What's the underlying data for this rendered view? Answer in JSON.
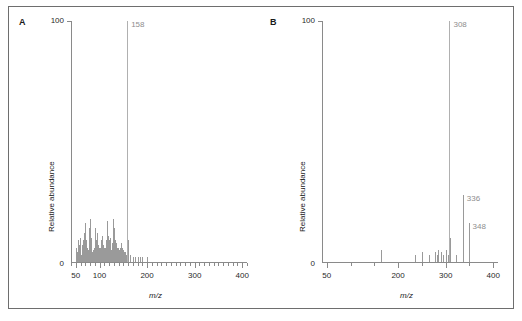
{
  "figure": {
    "width": 522,
    "height": 321,
    "background": "#ffffff",
    "frame_color": "#6e6e6e",
    "axis_color": "#8a8a8a",
    "peak_color": "#9a9a9a",
    "label_color": "#8e8e8e"
  },
  "panels": [
    {
      "letter": "A",
      "y_max_label": "100",
      "y_min_label": "0",
      "y_title": "Relative abundance",
      "x_title": "m/z",
      "annotations": [
        {
          "text": "158",
          "mz": 158
        }
      ]
    },
    {
      "letter": "B",
      "y_max_label": "100",
      "y_min_label": "0",
      "y_title": "Relative abundance",
      "x_title": "m/z",
      "annotations": [
        {
          "text": "308",
          "mz": 308
        },
        {
          "text": "336",
          "mz": 336
        },
        {
          "text": "348",
          "mz": 348
        }
      ]
    }
  ],
  "chart_data": [
    {
      "type": "bar",
      "title": "A",
      "xlabel": "m/z",
      "ylabel": "Relative abundance",
      "xlim": [
        40,
        410
      ],
      "ylim": [
        0,
        100
      ],
      "xticks": [
        50,
        100,
        200,
        300,
        400
      ],
      "xtick_labels": [
        "50",
        "100",
        "200",
        "300",
        "400"
      ],
      "xminor_step": 10,
      "yticks": [
        0,
        100
      ],
      "ytick_labels": [
        "0",
        "100"
      ],
      "grid": false,
      "legend": "none",
      "x": [
        51,
        53,
        55,
        56,
        57,
        58,
        59,
        60,
        63,
        65,
        66,
        67,
        68,
        69,
        70,
        71,
        72,
        73,
        74,
        75,
        77,
        78,
        79,
        80,
        81,
        82,
        83,
        85,
        86,
        87,
        89,
        91,
        92,
        93,
        94,
        95,
        96,
        97,
        98,
        99,
        100,
        101,
        102,
        103,
        104,
        105,
        106,
        107,
        108,
        109,
        110,
        111,
        112,
        113,
        114,
        115,
        116,
        117,
        118,
        119,
        120,
        121,
        122,
        123,
        124,
        125,
        126,
        127,
        128,
        129,
        130,
        131,
        132,
        133,
        134,
        135,
        136,
        137,
        138,
        139,
        140,
        141,
        142,
        143,
        144,
        145,
        146,
        147,
        148,
        149,
        150,
        151,
        152,
        153,
        155,
        156,
        157,
        158,
        159,
        160,
        165,
        170,
        175,
        180,
        185,
        190,
        200
      ],
      "values": [
        6,
        4,
        9,
        5,
        7,
        4,
        10,
        3,
        7,
        9,
        5,
        12,
        5,
        16,
        6,
        9,
        4,
        6,
        3,
        5,
        14,
        6,
        18,
        4,
        10,
        4,
        6,
        4,
        3,
        5,
        6,
        14,
        6,
        9,
        4,
        12,
        5,
        7,
        4,
        6,
        5,
        4,
        6,
        9,
        5,
        11,
        5,
        7,
        4,
        6,
        4,
        6,
        5,
        9,
        6,
        17,
        7,
        11,
        5,
        9,
        6,
        10,
        5,
        7,
        4,
        5,
        4,
        8,
        6,
        18,
        7,
        14,
        6,
        9,
        5,
        8,
        4,
        6,
        3,
        6,
        3,
        5,
        3,
        6,
        3,
        8,
        4,
        6,
        3,
        5,
        3,
        4,
        3,
        4,
        3,
        3,
        4,
        100,
        9,
        4,
        3,
        2,
        2,
        2,
        2,
        2,
        2
      ],
      "base_peak": {
        "mz": 158,
        "intensity": 100,
        "label": "158"
      },
      "labeled_peaks": [
        {
          "mz": 158,
          "intensity": 100,
          "label": "158"
        }
      ]
    },
    {
      "type": "bar",
      "title": "B",
      "xlabel": "m/z",
      "ylabel": "Relative abundance",
      "xlim": [
        40,
        410
      ],
      "ylim": [
        0,
        100
      ],
      "xticks": [
        50,
        200,
        300,
        400
      ],
      "xtick_labels": [
        "50",
        "200",
        "300",
        "400"
      ],
      "xminor_step": 50,
      "yticks": [
        0,
        100
      ],
      "ytick_labels": [
        "0",
        "100"
      ],
      "grid": false,
      "legend": "none",
      "x": [
        165,
        235,
        250,
        265,
        278,
        281,
        284,
        291,
        294,
        300,
        305,
        308,
        309,
        322,
        336,
        337,
        348,
        349
      ],
      "values": [
        5,
        3,
        4,
        3,
        4,
        3,
        5,
        4,
        3,
        5,
        3,
        100,
        10,
        3,
        28,
        5,
        16,
        3
      ],
      "base_peak": {
        "mz": 308,
        "intensity": 100,
        "label": "308"
      },
      "labeled_peaks": [
        {
          "mz": 308,
          "intensity": 100,
          "label": "308"
        },
        {
          "mz": 336,
          "intensity": 28,
          "label": "336"
        },
        {
          "mz": 348,
          "intensity": 16,
          "label": "348"
        }
      ]
    }
  ]
}
